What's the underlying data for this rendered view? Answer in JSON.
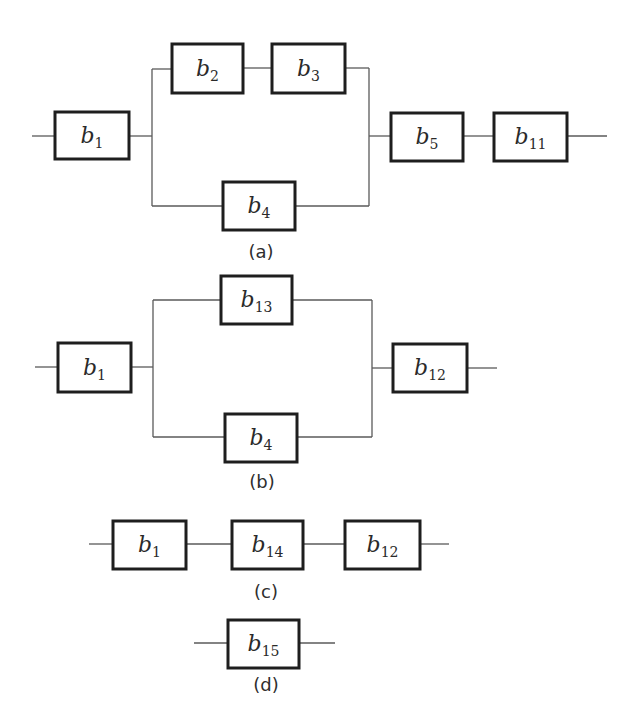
{
  "figure": {
    "colors": {
      "block_border": "#1e1e1e",
      "wire": "#5a5a5a",
      "text": "#2a2a2a",
      "background": "#ffffff"
    }
  },
  "diagrams": [
    {
      "id": "a",
      "caption": "(a)",
      "caption_pos": [
        261,
        252
      ],
      "blocks": [
        {
          "var": "b",
          "sub": "1",
          "x": 55,
          "y": 112,
          "w": 74,
          "h": 47
        },
        {
          "var": "b",
          "sub": "2",
          "x": 172,
          "y": 44,
          "w": 71,
          "h": 49
        },
        {
          "var": "b",
          "sub": "3",
          "x": 272,
          "y": 44,
          "w": 73,
          "h": 49
        },
        {
          "var": "b",
          "sub": "4",
          "x": 223,
          "y": 182,
          "w": 72,
          "h": 48
        },
        {
          "var": "b",
          "sub": "5",
          "x": 391,
          "y": 113,
          "w": 72,
          "h": 48
        },
        {
          "var": "b",
          "sub": "11",
          "x": 494,
          "y": 113,
          "w": 73,
          "h": 48
        }
      ],
      "wires": [
        "M32 136 H55",
        "M129 136 H152",
        "M152 69 V206",
        "M152 69 H172",
        "M243 68 H272",
        "M345 68 H369",
        "M369 68 V206",
        "M152 206 H223",
        "M295 206 H369",
        "M369 136 H391",
        "M463 136 H494",
        "M567 136 H607"
      ]
    },
    {
      "id": "b",
      "caption": "(b)",
      "caption_pos": [
        262,
        482
      ],
      "blocks": [
        {
          "var": "b",
          "sub": "1",
          "x": 58,
          "y": 343,
          "w": 73,
          "h": 49
        },
        {
          "var": "b",
          "sub": "13",
          "x": 221,
          "y": 276,
          "w": 71,
          "h": 48
        },
        {
          "var": "b",
          "sub": "4",
          "x": 225,
          "y": 414,
          "w": 72,
          "h": 48
        },
        {
          "var": "b",
          "sub": "12",
          "x": 393,
          "y": 344,
          "w": 74,
          "h": 48
        }
      ],
      "wires": [
        "M35 367 H58",
        "M131 367 H153",
        "M153 300 V437",
        "M153 300 H221",
        "M292 300 H372",
        "M372 300 V437",
        "M153 437 H225",
        "M297 437 H372",
        "M372 368 H393",
        "M467 368 H497"
      ]
    },
    {
      "id": "c",
      "caption": "(c)",
      "caption_pos": [
        266,
        592
      ],
      "blocks": [
        {
          "var": "b",
          "sub": "1",
          "x": 113,
          "y": 521,
          "w": 73,
          "h": 48
        },
        {
          "var": "b",
          "sub": "14",
          "x": 232,
          "y": 521,
          "w": 71,
          "h": 48
        },
        {
          "var": "b",
          "sub": "12",
          "x": 345,
          "y": 521,
          "w": 75,
          "h": 48
        }
      ],
      "wires": [
        "M89 544 H113",
        "M186 544 H232",
        "M303 544 H345",
        "M420 544 H449"
      ]
    },
    {
      "id": "d",
      "caption": "(d)",
      "caption_pos": [
        266,
        685
      ],
      "blocks": [
        {
          "var": "b",
          "sub": "15",
          "x": 228,
          "y": 620,
          "w": 71,
          "h": 48
        }
      ],
      "wires": [
        "M194 643 H228",
        "M299 643 H335"
      ]
    }
  ]
}
